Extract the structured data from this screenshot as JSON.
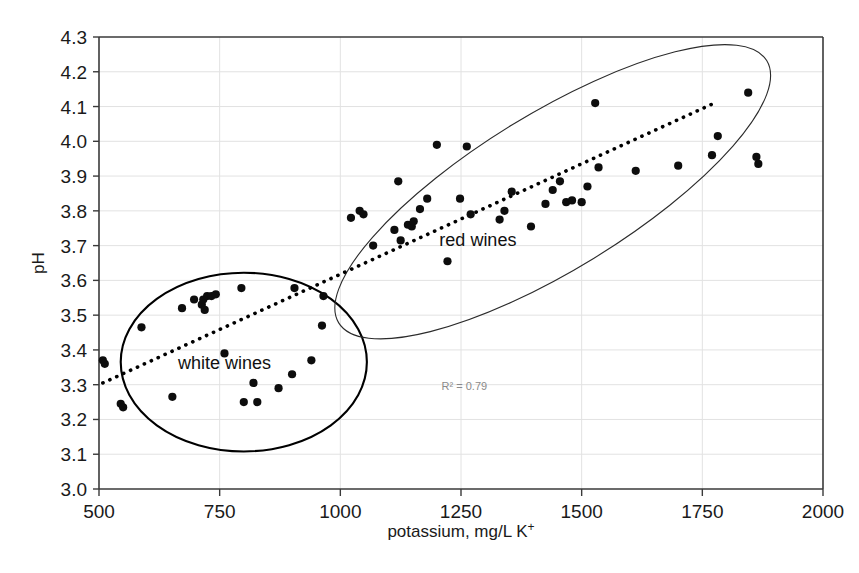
{
  "chart_data": {
    "type": "scatter",
    "title": "",
    "xlabel": "potassium, mg/L K+",
    "xlabel_base": "potassium, mg/L K",
    "xlabel_sup": "+",
    "ylabel": "pH",
    "xlim": [
      500,
      2000
    ],
    "ylim": [
      3.0,
      4.3
    ],
    "xticks": [
      500,
      750,
      1000,
      1250,
      1500,
      1750,
      2000
    ],
    "yticks": [
      3.0,
      3.1,
      3.2,
      3.3,
      3.4,
      3.5,
      3.6,
      3.7,
      3.8,
      3.9,
      4.0,
      4.1,
      4.2,
      4.3
    ],
    "xtick_labels": [
      "500",
      "750",
      "1000",
      "1250",
      "1500",
      "1750",
      "2000"
    ],
    "ytick_labels": [
      "3.0",
      "3.1",
      "3.2",
      "3.3",
      "3.4",
      "3.5",
      "3.6",
      "3.7",
      "3.8",
      "3.9",
      "4.0",
      "4.1",
      "4.2",
      "4.3"
    ],
    "grid": true,
    "grid_axis": "both",
    "legend": "none",
    "marker": "filled-circle",
    "marker_color": "#0d0d0d",
    "marker_size": 7,
    "series": [
      {
        "name": "white wines",
        "points": [
          [
            508,
            3.37
          ],
          [
            512,
            3.36
          ],
          [
            545,
            3.245
          ],
          [
            550,
            3.235
          ],
          [
            588,
            3.465
          ],
          [
            652,
            3.265
          ],
          [
            672,
            3.52
          ],
          [
            697,
            3.545
          ],
          [
            713,
            3.53
          ],
          [
            716,
            3.545
          ],
          [
            719,
            3.515
          ],
          [
            724,
            3.555
          ],
          [
            733,
            3.555
          ],
          [
            742,
            3.56
          ],
          [
            760,
            3.39
          ],
          [
            795,
            3.578
          ],
          [
            800,
            3.25
          ],
          [
            820,
            3.305
          ],
          [
            828,
            3.25
          ],
          [
            872,
            3.29
          ],
          [
            900,
            3.33
          ],
          [
            905,
            3.578
          ],
          [
            940,
            3.37
          ],
          [
            962,
            3.47
          ],
          [
            965,
            3.555
          ]
        ]
      },
      {
        "name": "red wines",
        "points": [
          [
            1022,
            3.78
          ],
          [
            1040,
            3.8
          ],
          [
            1048,
            3.79
          ],
          [
            1068,
            3.7
          ],
          [
            1112,
            3.745
          ],
          [
            1120,
            3.885
          ],
          [
            1125,
            3.715
          ],
          [
            1140,
            3.76
          ],
          [
            1148,
            3.755
          ],
          [
            1152,
            3.77
          ],
          [
            1165,
            3.805
          ],
          [
            1180,
            3.835
          ],
          [
            1200,
            3.99
          ],
          [
            1222,
            3.655
          ],
          [
            1248,
            3.835
          ],
          [
            1262,
            3.985
          ],
          [
            1270,
            3.79
          ],
          [
            1330,
            3.775
          ],
          [
            1340,
            3.8
          ],
          [
            1355,
            3.855
          ],
          [
            1395,
            3.755
          ],
          [
            1425,
            3.82
          ],
          [
            1440,
            3.86
          ],
          [
            1455,
            3.885
          ],
          [
            1468,
            3.825
          ],
          [
            1480,
            3.83
          ],
          [
            1500,
            3.825
          ],
          [
            1512,
            3.87
          ],
          [
            1528,
            4.11
          ],
          [
            1535,
            3.925
          ],
          [
            1612,
            3.915
          ],
          [
            1700,
            3.93
          ],
          [
            1770,
            3.96
          ],
          [
            1782,
            4.015
          ],
          [
            1845,
            4.14
          ],
          [
            1862,
            3.955
          ],
          [
            1866,
            3.935
          ]
        ]
      }
    ],
    "annotations": [
      {
        "text": "red wines",
        "x": 1285,
        "y": 3.7,
        "kind": "cluster-label"
      },
      {
        "text": "white wines",
        "x": 760,
        "y": 3.345,
        "kind": "cluster-label"
      },
      {
        "text": "R² = 0.79",
        "x": 1257,
        "y": 3.285,
        "kind": "r2-label",
        "color": "#8a8a8a"
      }
    ],
    "trendline": {
      "style": "dotted",
      "color": "#000000",
      "x_start": 508,
      "y_start": 3.305,
      "x_end": 1775,
      "y_end": 4.11,
      "r_squared": 0.79
    },
    "ellipses": [
      {
        "label": "white wines",
        "cx": 800,
        "cy": 3.365,
        "rx_data": 255,
        "ry_data": 0.257,
        "rotation_deg": 0,
        "stroke": "#000000",
        "stroke_width": 2.1
      },
      {
        "label": "red wines",
        "cx": 1440,
        "cy": 3.855,
        "rx_data": 520,
        "ry_data": 0.225,
        "rotation_deg": -31.5,
        "stroke": "#2b2b2b",
        "stroke_width": 1.1
      }
    ]
  },
  "figure": {
    "width": 859,
    "height": 573,
    "background": "#ffffff",
    "plot_area": {
      "left": 99,
      "top": 37,
      "right": 823,
      "bottom": 489
    }
  }
}
